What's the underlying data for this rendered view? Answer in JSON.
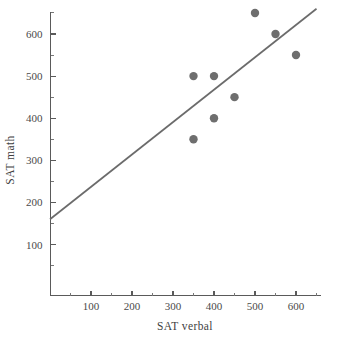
{
  "chart_data": {
    "type": "scatter",
    "title": "",
    "xlabel": "SAT verbal",
    "ylabel": "SAT math",
    "xlim": [
      0,
      660
    ],
    "ylim": [
      0,
      675
    ],
    "grid": false,
    "legend": "none",
    "points": [
      {
        "x": 350,
        "y": 500
      },
      {
        "x": 350,
        "y": 350
      },
      {
        "x": 400,
        "y": 500
      },
      {
        "x": 400,
        "y": 400
      },
      {
        "x": 450,
        "y": 450
      },
      {
        "x": 500,
        "y": 650
      },
      {
        "x": 550,
        "y": 600
      },
      {
        "x": 600,
        "y": 550
      }
    ],
    "series": [
      {
        "name": "SAT scores",
        "x": [
          350,
          350,
          400,
          400,
          450,
          500,
          550,
          600
        ],
        "values": [
          500,
          350,
          500,
          400,
          450,
          650,
          600,
          550
        ]
      }
    ],
    "trendline": {
      "type": "line",
      "label": "",
      "x": [
        0,
        650
      ],
      "values": [
        160,
        660
      ]
    },
    "x_major_ticks": [
      100,
      200,
      300,
      400,
      500,
      600
    ],
    "x_minor_ticks": [
      50,
      150,
      250,
      350,
      450,
      550,
      650
    ],
    "x_tick_labels": [
      "100",
      "200",
      "300",
      "400",
      "500",
      "600"
    ],
    "y_major_ticks": [
      100,
      200,
      300,
      400,
      500,
      600
    ],
    "y_minor_ticks": [
      50,
      150,
      250,
      350,
      450,
      550,
      650
    ],
    "y_tick_labels": [
      "100",
      "200",
      "300",
      "400",
      "500",
      "600"
    ],
    "marker": {
      "shape": "circle",
      "radius": 4.2,
      "color": "#6e6e6e"
    },
    "line_color": "#6b6b6b",
    "axis_color": "#5a5a5a",
    "background": "#ffffff"
  },
  "axes": {
    "x_title": "SAT verbal",
    "y_title": "SAT math"
  }
}
